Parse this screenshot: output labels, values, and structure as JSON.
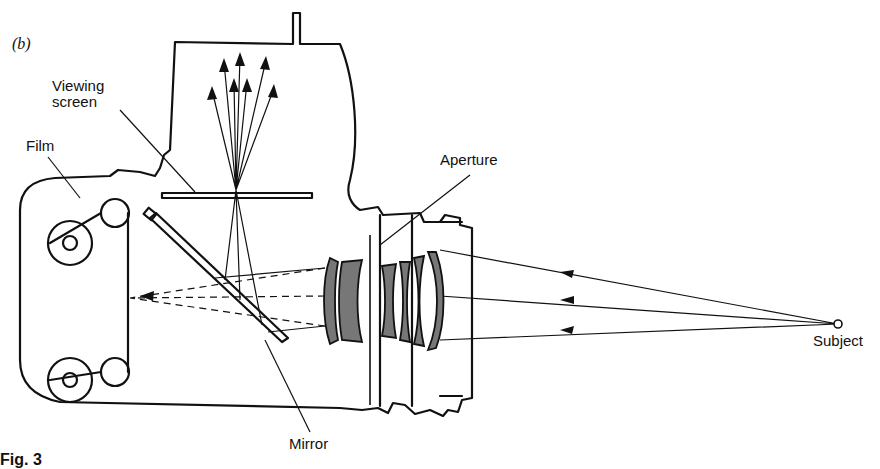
{
  "figure": {
    "panel_label": "(b)",
    "caption_fragment": "Fig. 3",
    "labels": {
      "viewing_screen": "Viewing\nscreen",
      "film": "Film",
      "aperture": "Aperture",
      "mirror": "Mirror",
      "subject": "Subject"
    },
    "colors": {
      "ink": "#111111",
      "lens_fill": "#777777",
      "background": "#ffffff"
    }
  }
}
